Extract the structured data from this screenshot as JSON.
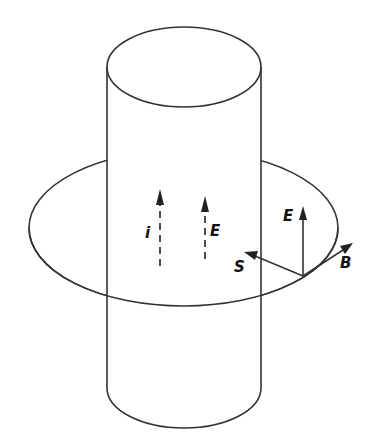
{
  "figure": {
    "labels": {
      "current": "i",
      "field_inside": "E",
      "field_surface": "E",
      "poynting": "S",
      "magnetic": "B"
    },
    "colors": {
      "line": "#333333",
      "text": "#111111",
      "background": "#ffffff"
    }
  }
}
